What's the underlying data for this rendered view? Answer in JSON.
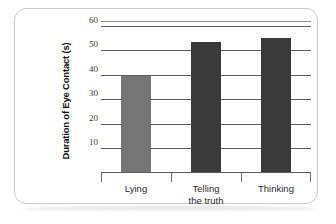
{
  "chart_data": {
    "type": "bar",
    "title": "",
    "xlabel": "",
    "ylabel": "Duration of Eye Contact (s)",
    "categories": [
      "Lying",
      "Telling\nthe truth",
      "Thinking"
    ],
    "values": [
      39,
      53,
      54.5
    ],
    "ylim": [
      0,
      62
    ],
    "yticks": [
      10,
      20,
      30,
      40,
      50,
      60
    ],
    "ytick_labels": [
      "10",
      "20",
      "30",
      "40",
      "50",
      "60"
    ],
    "grid": true,
    "legend": "none",
    "bar_colors": [
      "#757575",
      "#3a3a3a",
      "#3a3a3a"
    ],
    "axis_color": "#5b5b5b",
    "frame_color": "#c9c9c9"
  }
}
